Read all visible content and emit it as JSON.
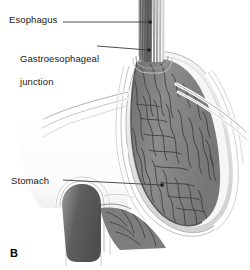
{
  "figure": {
    "panel_letter": "B",
    "labels": {
      "esophagus": "Esophagus",
      "gastroesophageal_junction_line1": "Gastroesophageal",
      "gastroesophageal_junction_line2": "junction",
      "stomach": "Stomach"
    },
    "colors": {
      "background": "#ffffff",
      "text": "#1a1a1a",
      "leader_line": "#3b3b3b",
      "mucosa_fill": "#8a8a8a",
      "mucosa_dark": "#6d6d6d",
      "rugae_stroke": "#39393b",
      "wall_outer": "#c9c9c9",
      "wall_mid": "#e2e2e2",
      "lumen_light": "#f2f2f2",
      "esophagus_lumen": "#6a6a6a",
      "duodenum_lumen": "#626262",
      "serosa_stroke": "#9a9a9a"
    }
  }
}
